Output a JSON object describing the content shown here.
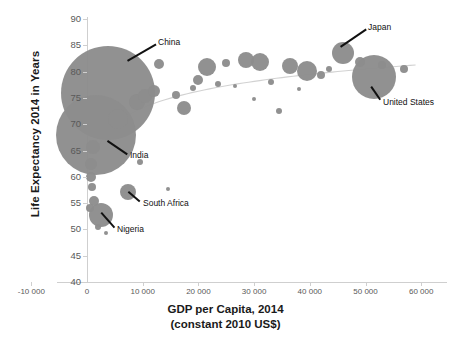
{
  "chart_data": {
    "type": "scatter",
    "title": "",
    "xlabel": "GDP per Capita, 2014 (constant 2010 US$)",
    "ylabel": "Life Expectancy 2014 in Years",
    "xlim": [
      -10000,
      60000
    ],
    "ylim": [
      40,
      90
    ],
    "xticks": [
      "-10 000",
      "0",
      "10 000",
      "20 000",
      "30 000",
      "40 000",
      "50 000",
      "60 000"
    ],
    "xtick_values": [
      -10000,
      0,
      10000,
      20000,
      30000,
      40000,
      50000,
      60000
    ],
    "yticks": [
      "40",
      "45",
      "50",
      "55",
      "60",
      "65",
      "70",
      "75",
      "80",
      "85",
      "90"
    ],
    "ytick_values": [
      40,
      45,
      50,
      55,
      60,
      65,
      70,
      75,
      80,
      85,
      90
    ],
    "grid": false,
    "legend": "none",
    "bubble_color": "#8d8d8d",
    "trendline": true,
    "size_encodes": "population",
    "points": [
      {
        "label": "China",
        "x": 3800,
        "y": 76.0,
        "r": 47
      },
      {
        "label": "India",
        "x": 1600,
        "y": 68.0,
        "r": 40
      },
      {
        "label": "Nigeria",
        "x": 2500,
        "y": 52.8,
        "r": 12
      },
      {
        "label": "South Africa",
        "x": 7400,
        "y": 57.2,
        "r": 8
      },
      {
        "label": "Japan",
        "x": 46000,
        "y": 83.6,
        "r": 11
      },
      {
        "label": "United States",
        "x": 51500,
        "y": 79.0,
        "r": 22
      },
      {
        "label": "",
        "x": 1100,
        "y": 65.6,
        "r": 7
      },
      {
        "label": "",
        "x": 800,
        "y": 62.5,
        "r": 6
      },
      {
        "label": "",
        "x": 700,
        "y": 60.0,
        "r": 5
      },
      {
        "label": "",
        "x": 900,
        "y": 58.0,
        "r": 4
      },
      {
        "label": "",
        "x": 1200,
        "y": 55.4,
        "r": 5
      },
      {
        "label": "",
        "x": 600,
        "y": 54.0,
        "r": 4
      },
      {
        "label": "",
        "x": 2000,
        "y": 50.4,
        "r": 3
      },
      {
        "label": "",
        "x": 3500,
        "y": 49.3,
        "r": 2
      },
      {
        "label": "",
        "x": 5500,
        "y": 71.0,
        "r": 10
      },
      {
        "label": "",
        "x": 9000,
        "y": 74.2,
        "r": 8
      },
      {
        "label": "",
        "x": 10500,
        "y": 75.4,
        "r": 7
      },
      {
        "label": "",
        "x": 12000,
        "y": 76.3,
        "r": 6
      },
      {
        "label": "",
        "x": 9500,
        "y": 62.8,
        "r": 3
      },
      {
        "label": "",
        "x": 14500,
        "y": 57.6,
        "r": 2
      },
      {
        "label": "",
        "x": 13000,
        "y": 81.4,
        "r": 5
      },
      {
        "label": "",
        "x": 16000,
        "y": 75.6,
        "r": 4
      },
      {
        "label": "",
        "x": 17500,
        "y": 73.0,
        "r": 7
      },
      {
        "label": "",
        "x": 19000,
        "y": 76.8,
        "r": 3
      },
      {
        "label": "",
        "x": 20000,
        "y": 78.4,
        "r": 5
      },
      {
        "label": "",
        "x": 21500,
        "y": 80.8,
        "r": 9
      },
      {
        "label": "",
        "x": 23500,
        "y": 77.6,
        "r": 3
      },
      {
        "label": "",
        "x": 25000,
        "y": 81.6,
        "r": 4
      },
      {
        "label": "",
        "x": 26500,
        "y": 77.2,
        "r": 2
      },
      {
        "label": "",
        "x": 28500,
        "y": 82.2,
        "r": 8
      },
      {
        "label": "",
        "x": 31000,
        "y": 81.8,
        "r": 9
      },
      {
        "label": "",
        "x": 30000,
        "y": 74.8,
        "r": 2
      },
      {
        "label": "",
        "x": 33000,
        "y": 78.0,
        "r": 3
      },
      {
        "label": "",
        "x": 34500,
        "y": 72.5,
        "r": 3
      },
      {
        "label": "",
        "x": 36500,
        "y": 81.0,
        "r": 8
      },
      {
        "label": "",
        "x": 39500,
        "y": 80.2,
        "r": 10
      },
      {
        "label": "",
        "x": 38000,
        "y": 76.6,
        "r": 2
      },
      {
        "label": "",
        "x": 42000,
        "y": 79.4,
        "r": 4
      },
      {
        "label": "",
        "x": 43500,
        "y": 80.4,
        "r": 3
      },
      {
        "label": "",
        "x": 49000,
        "y": 81.8,
        "r": 5
      },
      {
        "label": "",
        "x": 53000,
        "y": 81.2,
        "r": 4
      },
      {
        "label": "",
        "x": 52000,
        "y": 75.8,
        "r": 3
      },
      {
        "label": "",
        "x": 57000,
        "y": 80.4,
        "r": 4
      }
    ],
    "annotations": [
      {
        "name": "china",
        "label": "China"
      },
      {
        "name": "india",
        "label": "India"
      },
      {
        "name": "south-africa",
        "label": "South Africa"
      },
      {
        "name": "nigeria",
        "label": "Nigeria"
      },
      {
        "name": "japan",
        "label": "Japan"
      },
      {
        "name": "united-states",
        "label": "United States"
      }
    ]
  },
  "axes": {
    "y_title": "Life Expectancy 2014 in Years",
    "x_title_line1": "GDP per Capita, 2014",
    "x_title_line2": "(constant 2010 US$)"
  }
}
